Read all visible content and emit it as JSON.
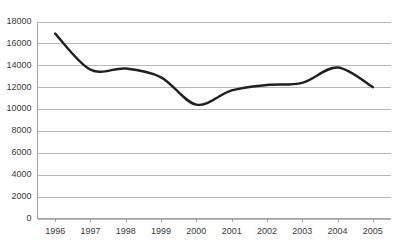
{
  "chart_data": {
    "type": "line",
    "title": "",
    "subtitle": "",
    "xlabel": "",
    "ylabel": "",
    "categories": [
      "1996",
      "1997",
      "1998",
      "1999",
      "2000",
      "2001",
      "2002",
      "2003",
      "2004",
      "2005"
    ],
    "values": [
      16900,
      13600,
      13700,
      12900,
      10400,
      11700,
      12200,
      12400,
      13800,
      12000
    ],
    "series": [
      {
        "name": "",
        "values": [
          16900,
          13600,
          13700,
          12900,
          10400,
          11700,
          12200,
          12400,
          13800,
          12000
        ],
        "color": "#221f1f"
      }
    ],
    "ylim": [
      0,
      18000
    ],
    "ytick_values": [
      0,
      2000,
      4000,
      6000,
      8000,
      10000,
      12000,
      14000,
      16000,
      18000
    ],
    "ytick_labels": [
      "0",
      "2000",
      "4000",
      "6000",
      "8000",
      "10000",
      "12000",
      "14000",
      "16000",
      "18000"
    ],
    "xtick_labels": [
      "1996",
      "1997",
      "1998",
      "1999",
      "2000",
      "2001",
      "2002",
      "2003",
      "2004",
      "2005"
    ],
    "grid": "horizontal",
    "legend": "none",
    "smoothing": "spline",
    "annotations": []
  },
  "colors": {
    "series_line": "#221f1f",
    "gridline": "#9a9a9a",
    "axis": "#8c8c8c",
    "tick_text": "#3a3a3a",
    "background": "#ffffff"
  }
}
